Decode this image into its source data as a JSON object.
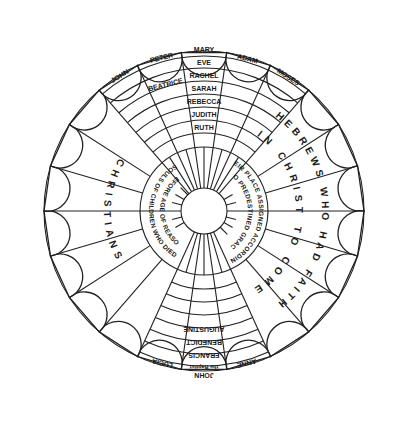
{
  "diagram": {
    "title": "",
    "colors": {
      "ink": "#222222",
      "background": "#ffffff"
    },
    "geometry": {
      "center": [
        204,
        211
      ],
      "hub_radius": 23,
      "inner_band_radius": 64,
      "ring_radius": 160,
      "petal_count": 22
    },
    "top_sector": {
      "petal_labels": [
        "JOHN",
        "PETER",
        "MARY",
        "ADAM",
        "MOSES"
      ],
      "center_column": [
        "MARY",
        "EVE",
        "RACHEL",
        "SARAH",
        "REBECCA",
        "JUDITH",
        "RUTH"
      ],
      "second_row_left": "BEATRICE"
    },
    "bottom_sector": {
      "petal_labels": [
        "LUCIA",
        "JOHN the Baptist",
        "ANNE"
      ],
      "center_column": [
        "JOHN",
        "the Baptist",
        "FRANCIS",
        "BENEDICT",
        "AUGUSTINE"
      ]
    },
    "right_sector": {
      "outer_label": "HEBREWS WHO HAD FAITH",
      "inner_label": "IN CHRIST TO COME",
      "band_outer": "THEIR PLACE ASSIGNED ACCORDING",
      "band_inner": "TO PREDESTINED GRACE"
    },
    "left_sector": {
      "label": "CHRISTIANS",
      "band_outer": "SOULS OF CHILDREN WHO DIED",
      "band_inner": "BEFORE AGE OF REASON"
    }
  }
}
